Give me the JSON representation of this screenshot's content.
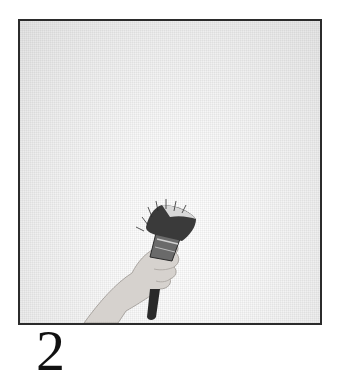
{
  "figure": {
    "number": "2",
    "colors": {
      "frame_border": "#2b2b2b",
      "background": "#ececec",
      "skin": "#d8d4d0",
      "brush_handle": "#2a2a2a",
      "bristles": "#3a3a3a"
    }
  }
}
